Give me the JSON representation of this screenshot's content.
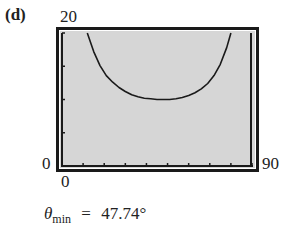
{
  "panel_label": "(d)",
  "chart_data": {
    "type": "line",
    "title": "",
    "xlabel": "",
    "ylabel": "",
    "xlim": [
      0,
      90
    ],
    "ylim": [
      0,
      20
    ],
    "x_tick_step": 10,
    "y_tick_step": 5,
    "grid": false,
    "legend": null,
    "window_labels": {
      "ymax": "20",
      "ymin": "0",
      "xmin": "0",
      "xmax": "90"
    },
    "series": [
      {
        "name": "curve",
        "x": [
          12,
          15,
          18,
          21,
          24,
          27,
          30,
          33,
          36,
          39,
          42,
          45,
          47.74,
          51,
          54,
          57,
          60,
          63,
          66,
          69,
          72,
          75,
          78,
          80
        ],
        "y": [
          20,
          17.2,
          15.1,
          13.6,
          12.6,
          11.8,
          11.2,
          10.7,
          10.4,
          10.2,
          10.1,
          10.0,
          10.0,
          10.0,
          10.1,
          10.3,
          10.6,
          11.0,
          11.6,
          12.4,
          13.6,
          15.3,
          17.8,
          20
        ]
      }
    ],
    "annotation": {
      "symbol": "θ",
      "subscript": "min",
      "equals": "=",
      "value": "47.74°"
    }
  },
  "colors": {
    "plot_background": "#d6d6d6",
    "frame": "#1a1a1a",
    "curve": "#1a1a1a"
  }
}
